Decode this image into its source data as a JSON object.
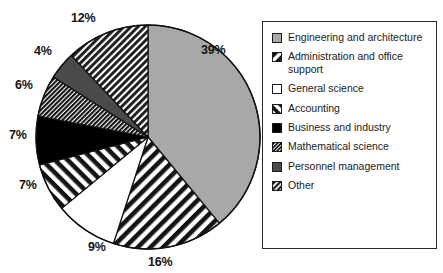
{
  "chart_data": {
    "type": "pie",
    "title": "",
    "xlabel": "",
    "ylabel": "",
    "legend_position": "right",
    "grid": false,
    "start_angle_deg": 0,
    "direction": "clockwise",
    "categories": [
      "Engineering and architecture",
      "Administration and office support",
      "General science",
      "Accounting",
      "Business and industry",
      "Mathematical science",
      "Personnel management",
      "Other"
    ],
    "values": [
      39,
      16,
      9,
      7,
      7,
      6,
      4,
      12
    ],
    "value_labels": [
      "39%",
      "16%",
      "9%",
      "7%",
      "7%",
      "6%",
      "4%",
      "12%"
    ],
    "slices": [
      {
        "label": "Engineering and architecture",
        "value": 39,
        "value_label": "39%",
        "pattern": "solid",
        "fill": "#a8a8a8",
        "start_deg": 0,
        "end_deg": 140.4
      },
      {
        "label": "Administration and office support",
        "value": 16,
        "value_label": "16%",
        "pattern": "diagonal-forward",
        "fill": "#ffffff",
        "start_deg": 140.4,
        "end_deg": 198.0
      },
      {
        "label": "General science",
        "value": 9,
        "value_label": "9%",
        "pattern": "blank",
        "fill": "#ffffff",
        "start_deg": 198.0,
        "end_deg": 230.4
      },
      {
        "label": "Accounting",
        "value": 7,
        "value_label": "7%",
        "pattern": "diagonal-back",
        "fill": "#ffffff",
        "start_deg": 230.4,
        "end_deg": 255.6
      },
      {
        "label": "Business and industry",
        "value": 7,
        "value_label": "7%",
        "pattern": "solid",
        "fill": "#000000",
        "start_deg": 255.6,
        "end_deg": 280.8
      },
      {
        "label": "Mathematical science",
        "value": 6,
        "value_label": "6%",
        "pattern": "diagonal-dense-dark",
        "fill": "#1c1c1c",
        "start_deg": 280.8,
        "end_deg": 302.4
      },
      {
        "label": "Personnel management",
        "value": 4,
        "value_label": "4%",
        "pattern": "solid",
        "fill": "#4a4a4a",
        "start_deg": 302.4,
        "end_deg": 316.8
      },
      {
        "label": "Other",
        "value": 12,
        "value_label": "12%",
        "pattern": "diagonal-dense",
        "fill": "#2a2a2a",
        "start_deg": 316.8,
        "end_deg": 360.0
      }
    ]
  },
  "pie": {
    "center_x": 148,
    "center_y": 137,
    "radius": 112,
    "outline_color": "#111111",
    "labels": [
      {
        "text": "39%",
        "x": 201,
        "y": 43
      },
      {
        "text": "16%",
        "x": 148,
        "y": 255
      },
      {
        "text": "9%",
        "x": 88,
        "y": 240
      },
      {
        "text": "7%",
        "x": 19,
        "y": 178
      },
      {
        "text": "7%",
        "x": 9,
        "y": 128
      },
      {
        "text": "6%",
        "x": 15,
        "y": 78
      },
      {
        "text": "4%",
        "x": 34,
        "y": 44
      },
      {
        "text": "12%",
        "x": 71,
        "y": 11
      }
    ]
  },
  "legend": {
    "border_color": "#2b2b2b",
    "items": [
      {
        "label": "Engineering and architecture",
        "pattern": "solid",
        "fill": "#a8a8a8"
      },
      {
        "label": "Administration and office support",
        "pattern": "diagonal-forward",
        "fill": "#ffffff"
      },
      {
        "label": "General science",
        "pattern": "blank",
        "fill": "#ffffff"
      },
      {
        "label": "Accounting",
        "pattern": "diagonal-back",
        "fill": "#ffffff"
      },
      {
        "label": "Business and industry",
        "pattern": "solid",
        "fill": "#000000"
      },
      {
        "label": "Mathematical science",
        "pattern": "diagonal-dense-dark",
        "fill": "#1c1c1c"
      },
      {
        "label": "Personnel management",
        "pattern": "solid",
        "fill": "#4a4a4a"
      },
      {
        "label": "Other",
        "pattern": "diagonal-dense",
        "fill": "#2a2a2a"
      }
    ]
  }
}
